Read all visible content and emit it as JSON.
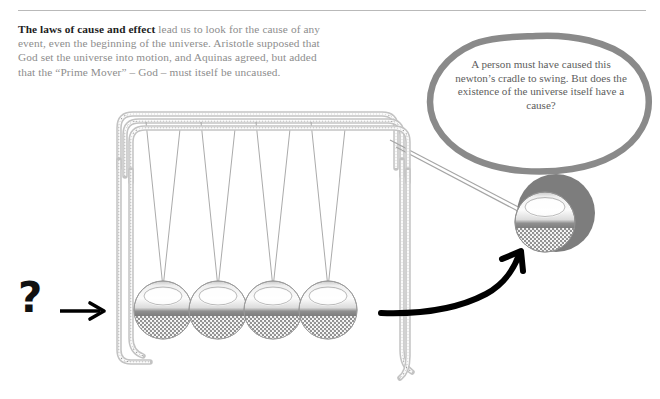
{
  "page": {
    "background_color": "#ffffff",
    "rule_color": "#b9b9b9"
  },
  "intro": {
    "lead": "The laws of cause and effect",
    "body": " lead us to look for the cause of any event, even the beginning of the universe. Aristotle supposed that God set the universe into motion, and Aquinas agreed, but added that the “Prime Mover” – God –  must itself be uncaused.",
    "lead_color": "#1d1d1d",
    "body_color": "#8d8d8d"
  },
  "speech_bubble": {
    "text": "A person must have caused this newton’s cradle to swing. But does the existence of the universe itself have a cause?",
    "outline_color": "#8a8a8a",
    "text_color": "#5d5d5d"
  },
  "annotations": {
    "question_mark": "?",
    "question_mark_color": "#111111",
    "left_arrow_name": "arrow pointing right at cradle",
    "curved_arrow_name": "curved arrow pointing to raised ball",
    "bubble_pointer_name": "arrow from speech bubble to raised ball",
    "arrow_color": "#000000"
  },
  "illustration": {
    "title": "newton's cradle",
    "frame_color": "#9a9a9a",
    "frame_light": "#d8d8d8",
    "string_color": "#9d9d9d",
    "ball_count": 4,
    "balls": [
      {
        "label": "ball-1",
        "cx": 163,
        "cy": 310,
        "r": 29
      },
      {
        "label": "ball-2",
        "cx": 218,
        "cy": 310,
        "r": 29
      },
      {
        "label": "ball-3",
        "cx": 273,
        "cy": 310,
        "r": 29
      },
      {
        "label": "ball-4",
        "cx": 328,
        "cy": 310,
        "r": 29
      }
    ],
    "raised_ball": {
      "label": "ball-5-raised",
      "cx": 545,
      "cy": 222,
      "r": 30
    },
    "highlight_disc": {
      "label": "emphasis-disc",
      "cx": 556,
      "cy": 213,
      "r": 39,
      "color": "#7d7d7d"
    },
    "ball_top_color": "#e9e9e9",
    "ball_band_color": "#8e8e8e",
    "ball_bottom_color": "#b5b5b5"
  }
}
